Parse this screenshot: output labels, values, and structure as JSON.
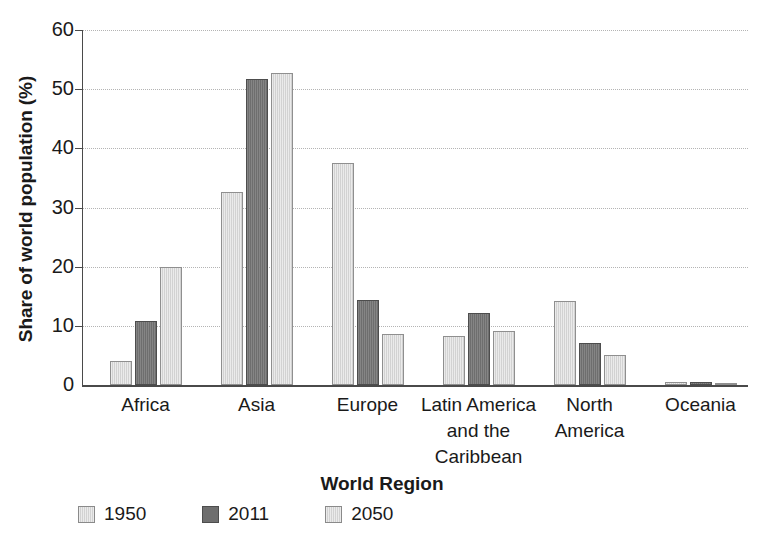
{
  "chart_data": {
    "type": "bar",
    "title": "",
    "xlabel": "World Region",
    "ylabel": "Share of world population (%)",
    "ylim": [
      0,
      60
    ],
    "yticks": [
      0,
      10,
      20,
      30,
      40,
      50,
      60
    ],
    "ytick_labels": [
      "0",
      "10",
      "20",
      "30",
      "40",
      "50",
      "60"
    ],
    "grid": "horizontal-dotted",
    "legend_position": "below-left",
    "categories": [
      "Africa",
      "Asia",
      "Europe",
      "Latin America\nand the\nCaribbean",
      "North\nAmerica",
      "Oceania"
    ],
    "series": [
      {
        "name": "1950",
        "color": "#d2d2d2",
        "values": [
          4.0,
          32.6,
          37.5,
          8.3,
          14.2,
          0.5
        ]
      },
      {
        "name": "2011",
        "color": "#6e6e6e",
        "values": [
          10.8,
          51.7,
          14.4,
          12.2,
          7.1,
          0.5
        ]
      },
      {
        "name": "2050",
        "color": "#d2d2d2",
        "values": [
          20.0,
          52.7,
          8.6,
          9.1,
          5.1,
          0.4
        ]
      }
    ]
  },
  "axes": {
    "y_title": "Share of world population (%)",
    "x_title": "World Region",
    "y_tick_0": "0",
    "y_tick_10": "10",
    "y_tick_20": "20",
    "y_tick_30": "30",
    "y_tick_40": "40",
    "y_tick_50": "50",
    "y_tick_60": "60"
  },
  "categories": {
    "africa": "Africa",
    "asia": "Asia",
    "europe": "Europe",
    "latin_america": "Latin America\nand the\nCaribbean",
    "north_america": "North\nAmerica",
    "oceania": "Oceania"
  },
  "legend": {
    "items": [
      {
        "label": "1950",
        "swatch": "light"
      },
      {
        "label": "2011",
        "swatch": "dark"
      },
      {
        "label": "2050",
        "swatch": "light"
      }
    ]
  },
  "colors": {
    "light_bar": "#d2d2d2",
    "dark_bar": "#6e6e6e",
    "axis": "#4a4a4a",
    "gridline": "#b4b4b4",
    "text": "#1a1a1a",
    "background": "#ffffff"
  }
}
